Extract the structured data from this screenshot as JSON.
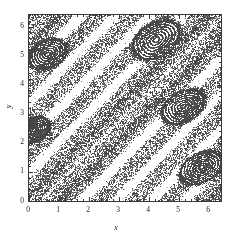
{
  "chart_data": {
    "type": "scatter",
    "title": "",
    "subtitle": "",
    "xlabel": "x",
    "ylabel": "y",
    "xlim": [
      0,
      6.4
    ],
    "ylim": [
      0,
      6.4
    ],
    "xticks": [
      0,
      1,
      2,
      3,
      4,
      5,
      6
    ],
    "yticks": [
      0,
      1,
      2,
      3,
      4,
      5,
      6
    ],
    "xticklabels": [
      "0",
      "1",
      "2",
      "3",
      "4",
      "5",
      "6"
    ],
    "yticklabels": [
      "0",
      "1",
      "2",
      "3",
      "4",
      "5",
      "6"
    ],
    "minor_ticks_per_interval": 5,
    "grid": false,
    "legend": null,
    "legend_position": "none",
    "marker": "point",
    "marker_size_px": 1,
    "point_color": "#555555",
    "frame_color": "#3a3a3a",
    "background_color": "#ffffff",
    "n_points_approx": 26000,
    "bands": [
      {
        "name": "band-1-lower-left",
        "intercept": -0.85,
        "slope": 1.05,
        "half_width": 0.42,
        "density": 1.0
      },
      {
        "name": "band-2",
        "intercept": 0.35,
        "slope": 1.05,
        "half_width": 0.4,
        "density": 1.0
      },
      {
        "name": "band-3",
        "intercept": 1.55,
        "slope": 1.05,
        "half_width": 0.38,
        "density": 1.0
      },
      {
        "name": "band-4",
        "intercept": 2.75,
        "slope": 1.05,
        "half_width": 0.4,
        "density": 1.0
      },
      {
        "name": "band-5",
        "intercept": 3.95,
        "slope": 1.05,
        "half_width": 0.38,
        "density": 1.0
      },
      {
        "name": "band-6",
        "intercept": 5.15,
        "slope": 1.05,
        "half_width": 0.36,
        "density": 0.95
      },
      {
        "name": "band-7-upper-left",
        "intercept": 6.35,
        "slope": 1.05,
        "half_width": 0.34,
        "density": 0.9
      }
    ],
    "islands": [
      {
        "name": "island-upper-left",
        "cx": 0.62,
        "cy": 5.05,
        "rx": 0.62,
        "ry": 0.42,
        "angle_deg": 28
      },
      {
        "name": "island-upper-mid",
        "cx": 4.25,
        "cy": 5.55,
        "rx": 0.8,
        "ry": 0.52,
        "angle_deg": 34
      },
      {
        "name": "island-center-right",
        "cx": 5.15,
        "cy": 3.25,
        "rx": 0.72,
        "ry": 0.46,
        "angle_deg": 32
      },
      {
        "name": "island-lower-right",
        "cx": 5.75,
        "cy": 1.15,
        "rx": 0.7,
        "ry": 0.44,
        "angle_deg": 30
      },
      {
        "name": "island-left-edge",
        "cx": 0.18,
        "cy": 2.45,
        "rx": 0.5,
        "ry": 0.36,
        "angle_deg": 30
      }
    ],
    "values_note": "Point cloud generated from the band/island geometry above; individual orbit coordinates are not individually labeled in the figure."
  },
  "axes": {
    "x": {
      "label": "x",
      "ticklabels": [
        "0",
        "1",
        "2",
        "3",
        "4",
        "5",
        "6"
      ]
    },
    "y": {
      "label": "y",
      "ticklabels": [
        "0",
        "1",
        "2",
        "3",
        "4",
        "5",
        "6"
      ]
    }
  }
}
